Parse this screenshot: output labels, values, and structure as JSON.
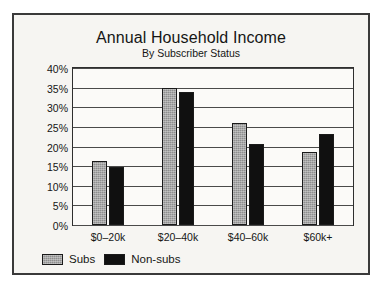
{
  "chart_data": {
    "type": "bar",
    "title": "Annual Household Income",
    "subtitle": "By Subscriber Status",
    "xlabel": "",
    "ylabel": "",
    "categories": [
      "$0–20k",
      "$20–40k",
      "$40–60k",
      "$60k+"
    ],
    "series": [
      {
        "name": "Subs",
        "color": "#8e8e8e",
        "values": [
          16.3,
          35.0,
          26.0,
          18.7
        ]
      },
      {
        "name": "Non-subs",
        "color": "#101010",
        "values": [
          14.8,
          34.0,
          20.6,
          23.3
        ]
      }
    ],
    "ylim": [
      0,
      40
    ],
    "ytick_values": [
      0,
      5,
      10,
      15,
      20,
      25,
      30,
      35,
      40
    ],
    "ytick_labels": [
      "0%",
      "5%",
      "10%",
      "15%",
      "20%",
      "25%",
      "30%",
      "35%",
      "40%"
    ],
    "y_unit": "%",
    "grid": true,
    "legend_position": "bottom-left"
  },
  "legend": {
    "items": [
      {
        "label": "Subs",
        "swatch": "gray-swatch"
      },
      {
        "label": "Non-subs",
        "swatch": "black-swatch"
      }
    ]
  }
}
